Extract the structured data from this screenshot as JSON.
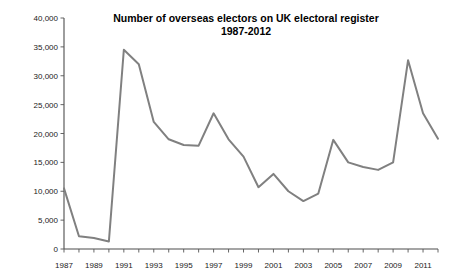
{
  "chart_data": {
    "type": "line",
    "title": "Number of overseas electors on UK electoral register",
    "subtitle": "1987-2012",
    "xlabel": "",
    "ylabel": "",
    "ylim": [
      0,
      40000
    ],
    "xlim": [
      1987,
      2012
    ],
    "grid": false,
    "legend": "none",
    "line_color": "#808080",
    "x": [
      1987,
      1988,
      1989,
      1990,
      1991,
      1992,
      1993,
      1994,
      1995,
      1996,
      1997,
      1998,
      1999,
      2000,
      2001,
      2002,
      2003,
      2004,
      2005,
      2006,
      2007,
      2008,
      2009,
      2010,
      2011,
      2012
    ],
    "values": [
      10500,
      2200,
      1900,
      1300,
      34500,
      32000,
      22000,
      19000,
      18000,
      17900,
      23500,
      19000,
      16000,
      10700,
      13000,
      10000,
      8300,
      9600,
      18900,
      15000,
      14200,
      13700,
      15000,
      32700,
      23500,
      19100
    ],
    "series": [
      {
        "name": "Overseas electors",
        "values": [
          10500,
          2200,
          1900,
          1300,
          34500,
          32000,
          22000,
          19000,
          18000,
          17900,
          23500,
          19000,
          16000,
          10700,
          13000,
          10000,
          8300,
          9600,
          18900,
          15000,
          14200,
          13700,
          15000,
          32700,
          23500,
          19100
        ]
      }
    ],
    "ytick_values": [
      0,
      5000,
      10000,
      15000,
      20000,
      25000,
      30000,
      35000,
      40000
    ],
    "ytick_labels": [
      "0",
      "5,000",
      "10,000",
      "15,000",
      "20,000",
      "25,000",
      "30,000",
      "35,000",
      "40,000"
    ],
    "xtick_values": [
      1987,
      1989,
      1991,
      1993,
      1995,
      1997,
      1999,
      2001,
      2003,
      2005,
      2007,
      2009,
      2011
    ],
    "xtick_labels": [
      "1987",
      "1989",
      "1991",
      "1993",
      "1995",
      "1997",
      "1999",
      "2001",
      "2003",
      "2005",
      "2007",
      "2009",
      "2011"
    ]
  }
}
